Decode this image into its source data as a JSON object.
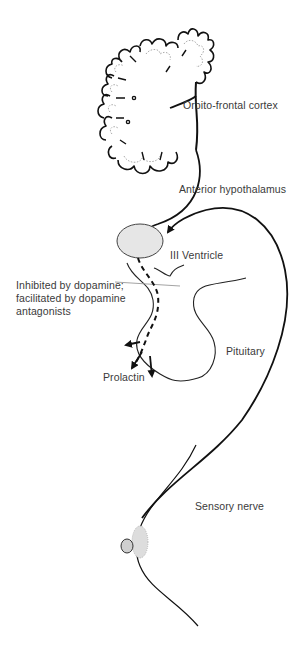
{
  "diagram": {
    "type": "physiological pathway (prolactin release reflex)",
    "labels": {
      "cortex": "Orbito-frontal cortex",
      "hypothalamus": "Anterior hypothalamus",
      "ventricle": "III Ventricle",
      "inhibition_line1": "Inhibited by dopamine;",
      "inhibition_line2": "facilitated by dopamine",
      "inhibition_line3": "antagonists",
      "pituitary": "Pituitary",
      "prolactin": "Prolactin",
      "sensory_nerve": "Sensory nerve"
    },
    "nodes": [
      {
        "id": "cortex",
        "label": "Orbito-frontal cortex"
      },
      {
        "id": "hypothalamus",
        "label": "Anterior hypothalamus"
      },
      {
        "id": "ventricle",
        "label": "III Ventricle"
      },
      {
        "id": "pituitary",
        "label": "Pituitary"
      },
      {
        "id": "prolactin",
        "label": "Prolactin"
      },
      {
        "id": "breast",
        "label": "Sensory nerve"
      }
    ],
    "edges": [
      {
        "from": "cortex",
        "to": "hypothalamus",
        "style": "solid-arrow"
      },
      {
        "from": "breast",
        "to": "hypothalamus",
        "via": "Sensory nerve",
        "style": "solid-arrow"
      },
      {
        "from": "hypothalamus",
        "to": "pituitary",
        "style": "dashed"
      },
      {
        "from": "pituitary",
        "to": "prolactin",
        "style": "solid-arrows"
      }
    ],
    "colors": {
      "line": "#111111",
      "hypothalamus_fill": "#e6e6e6",
      "text": "#3a3a3a"
    }
  }
}
